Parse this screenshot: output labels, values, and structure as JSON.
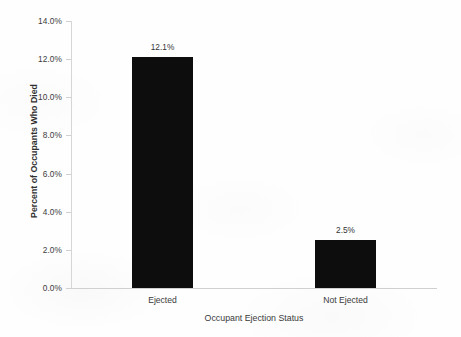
{
  "chart_data": {
    "type": "bar",
    "title": "",
    "xlabel": "Occupant Ejection Status",
    "ylabel": "Percent of Occupants Who Died",
    "categories": [
      "Ejected",
      "Not Ejected"
    ],
    "values": [
      12.1,
      2.5
    ],
    "data_labels": [
      "12.1%",
      "2.5%"
    ],
    "ylim": [
      0,
      14
    ],
    "ytick_step": 2,
    "ytick_labels": [
      "0.0%",
      "2.0%",
      "4.0%",
      "6.0%",
      "8.0%",
      "10.0%",
      "12.0%",
      "14.0%"
    ],
    "ytick_values": [
      0,
      2,
      4,
      6,
      8,
      10,
      12,
      14
    ],
    "grid": false,
    "legend": "none",
    "bar_color": "#0d0d0d",
    "axis_color": "#d0d0d0",
    "background_color": "#fefefe",
    "text_color": "#3a3a3a"
  }
}
